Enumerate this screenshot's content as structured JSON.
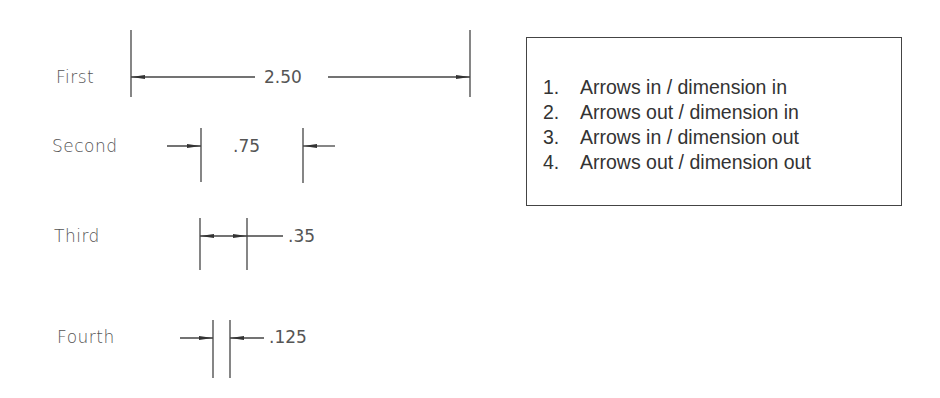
{
  "rows": [
    {
      "label": "First",
      "value": "2.50"
    },
    {
      "label": "Second",
      "value": ".75"
    },
    {
      "label": "Third",
      "value": ".35"
    },
    {
      "label": "Fourth",
      "value": ".125"
    }
  ],
  "legend": {
    "items": [
      {
        "num": "1.",
        "text": "Arrows in / dimension in"
      },
      {
        "num": "2.",
        "text": "Arrows out / dimension in"
      },
      {
        "num": "3.",
        "text": "Arrows in / dimension out"
      },
      {
        "num": "4.",
        "text": "Arrows out / dimension out"
      }
    ]
  },
  "colors": {
    "line": "#444444",
    "text": "#555555",
    "legend_text": "#333333"
  }
}
